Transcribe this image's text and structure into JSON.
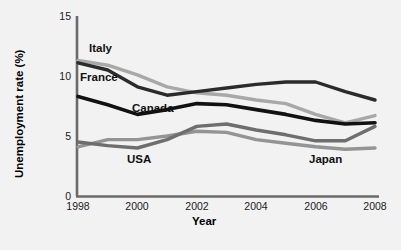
{
  "chart_data": {
    "type": "line",
    "title": "",
    "xlabel": "Year",
    "ylabel": "Unemployment rate (%)",
    "xlim": [
      1998,
      2008
    ],
    "ylim": [
      0,
      15
    ],
    "xticks": [
      1998,
      2000,
      2002,
      2004,
      2006,
      2008
    ],
    "yticks": [
      0,
      5,
      10,
      15
    ],
    "grid": false,
    "legend_position": "inline-annotations",
    "x": [
      1998,
      1999,
      2000,
      2001,
      2002,
      2003,
      2004,
      2005,
      2006,
      2007,
      2008
    ],
    "series": [
      {
        "name": "Italy",
        "color": "#a8a8a8",
        "values": [
          11.3,
          10.9,
          10.1,
          9.1,
          8.6,
          8.4,
          8.0,
          7.7,
          6.8,
          6.1,
          6.7
        ]
      },
      {
        "name": "France",
        "color": "#2b2b2b",
        "values": [
          11.1,
          10.5,
          9.1,
          8.4,
          8.7,
          9.0,
          9.3,
          9.5,
          9.5,
          8.7,
          8.0
        ]
      },
      {
        "name": "Canada",
        "color": "#111111",
        "values": [
          8.3,
          7.6,
          6.8,
          7.2,
          7.7,
          7.6,
          7.2,
          6.8,
          6.3,
          6.0,
          6.1
        ]
      },
      {
        "name": "USA",
        "color": "#6e6e6e",
        "values": [
          4.5,
          4.2,
          4.0,
          4.7,
          5.8,
          6.0,
          5.5,
          5.1,
          4.6,
          4.6,
          5.8
        ]
      },
      {
        "name": "Japan",
        "color": "#949494",
        "values": [
          4.1,
          4.7,
          4.7,
          5.0,
          5.4,
          5.3,
          4.7,
          4.4,
          4.1,
          3.9,
          4.0
        ]
      }
    ],
    "annotations": [
      {
        "text": "Italy",
        "x": 1998.6,
        "y": 12.5
      },
      {
        "text": "France",
        "x": 1998.2,
        "y": 10.1
      },
      {
        "text": "Canada",
        "x": 2000.3,
        "y": 7.5
      },
      {
        "text": "USA",
        "x": 2000.1,
        "y": 3.3
      },
      {
        "text": "Japan",
        "x": 2005.6,
        "y": 3.3
      }
    ]
  },
  "axis": {
    "x_title": "Year",
    "y_title": "Unemployment rate (%)",
    "xtick_labels": [
      "1998",
      "2000",
      "2002",
      "2004",
      "2006",
      "2008"
    ],
    "ytick_labels": [
      "0",
      "5",
      "10",
      "15"
    ]
  },
  "colors": {
    "background": "#f2f2f2",
    "axis": "#6a6a6a",
    "text": "#111111"
  }
}
